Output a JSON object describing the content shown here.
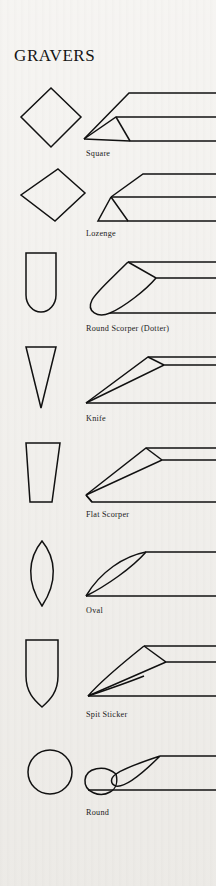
{
  "page": {
    "title": "GRAVERS",
    "background_color": "#f1efeb",
    "ink_color": "#111111",
    "width": 216,
    "height": 886
  },
  "figure": {
    "type": "illustration-plate",
    "columns": [
      "cross-section",
      "perspective-view",
      "name"
    ],
    "rows": [
      {
        "index": 1,
        "label": "Square",
        "cross_section": "diamond",
        "side_view": "square-graver-point"
      },
      {
        "index": 2,
        "label": "Lozenge",
        "cross_section": "lozenge-diamond",
        "side_view": "lozenge-graver-point"
      },
      {
        "index": 3,
        "label": "Round Scorper (Dotter)",
        "cross_section": "round-bottom-rectangle",
        "side_view": "round-scorper-point"
      },
      {
        "index": 4,
        "label": "Knife",
        "cross_section": "narrow-taper-triangle",
        "side_view": "knife-graver-point"
      },
      {
        "index": 5,
        "label": "Flat Scorper",
        "cross_section": "tapered-trapezoid",
        "side_view": "flat-scorper-point"
      },
      {
        "index": 6,
        "label": "Oval",
        "cross_section": "pointed-oval-lens",
        "side_view": "oval-graver-point"
      },
      {
        "index": 7,
        "label": "Spit Sticker",
        "cross_section": "shield-bullet",
        "side_view": "spit-sticker-point"
      },
      {
        "index": 8,
        "label": "Round",
        "cross_section": "circle",
        "side_view": "round-graver-point"
      }
    ]
  }
}
